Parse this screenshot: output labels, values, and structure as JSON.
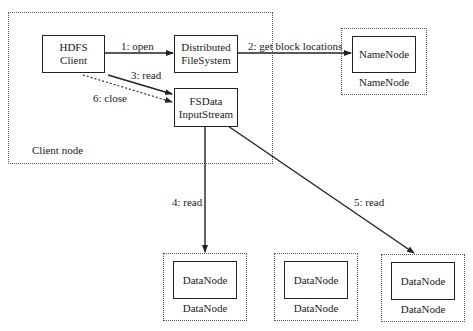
{
  "diagram": {
    "client_node": {
      "label": "Client node",
      "hdfs_client": {
        "line1": "HDFS",
        "line2": "Client"
      },
      "distributed_fs": {
        "line1": "Distributed",
        "line2": "FileSystem"
      },
      "fsdata_stream": {
        "line1": "FSData",
        "line2": "InputStream"
      }
    },
    "namenode": {
      "inner": "NameNode",
      "caption": "NameNode"
    },
    "datanodes": [
      {
        "inner": "DataNode",
        "caption": "DataNode"
      },
      {
        "inner": "DataNode",
        "caption": "DataNode"
      },
      {
        "inner": "DataNode",
        "caption": "DataNode"
      }
    ],
    "edges": [
      {
        "label": "1: open",
        "from": "HDFS Client",
        "to": "DistributedFileSystem",
        "style": "solid"
      },
      {
        "label": "2: get block locations",
        "from": "DistributedFileSystem",
        "to": "NameNode",
        "style": "solid"
      },
      {
        "label": "3: read",
        "from": "HDFS Client",
        "to": "FSDataInputStream",
        "style": "solid"
      },
      {
        "label": "4: read",
        "from": "FSDataInputStream",
        "to": "DataNode 1",
        "style": "solid"
      },
      {
        "label": "5: read",
        "from": "FSDataInputStream",
        "to": "DataNode 3",
        "style": "solid"
      },
      {
        "label": "6: close",
        "from": "HDFS Client",
        "to": "FSDataInputStream",
        "style": "dotted"
      }
    ]
  }
}
